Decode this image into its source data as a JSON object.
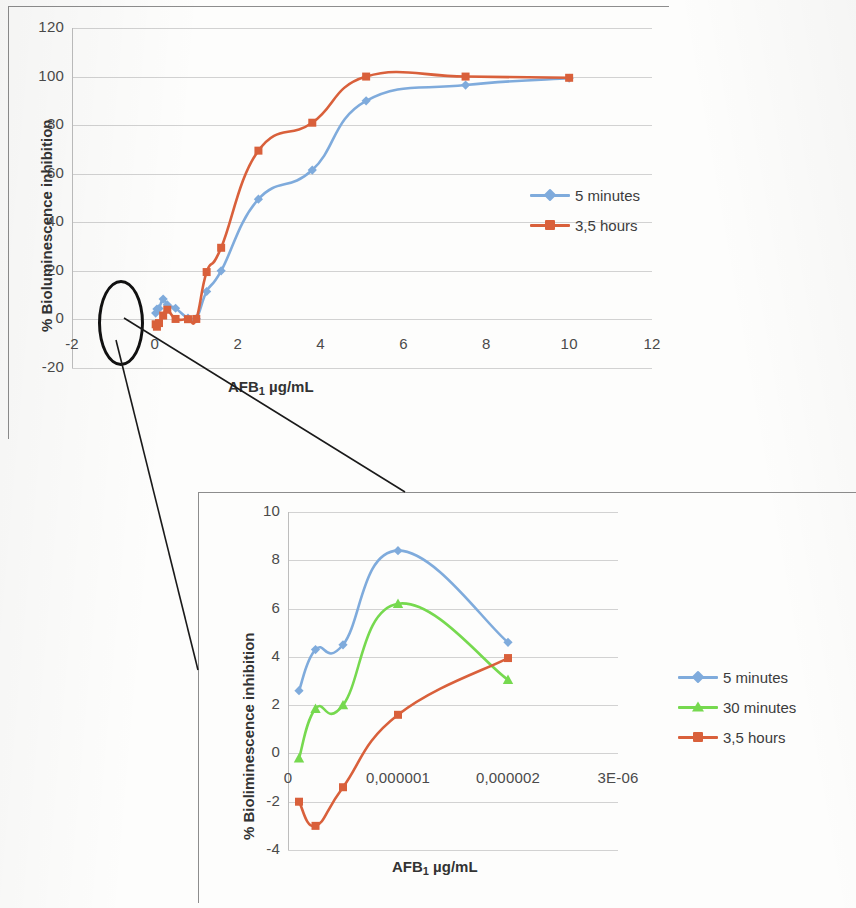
{
  "figure": {
    "kind": "scanned-figure"
  },
  "colors": {
    "series_blue": "#7FABDC",
    "series_green": "#76D94F",
    "series_orange": "#D9603B",
    "gridline": "#d2d2d2",
    "axis": "#bdbdbd",
    "text": "#4a4a4a",
    "annotation": "#111111"
  },
  "top_chart": {
    "ylabel": "% Bioluminescence inhibition",
    "xlabel_text": "AFB",
    "xlabel_sub": "1",
    "xlabel_tail": " µg/mL",
    "y_ticks": [
      "-20",
      "0",
      "20",
      "40",
      "60",
      "80",
      "100",
      "120"
    ],
    "x_ticks": [
      "-2",
      "0",
      "2",
      "4",
      "6",
      "8",
      "10",
      "12"
    ],
    "legend": [
      {
        "label": "5 minutes",
        "color": "#7FABDC",
        "marker": "diamond"
      },
      {
        "label": "3,5 hours",
        "color": "#D9603B",
        "marker": "square"
      }
    ]
  },
  "bottom_chart": {
    "ylabel": "% Bioliminescence inhibition",
    "xlabel_text": "AFB",
    "xlabel_sub": "1",
    "xlabel_tail": " µg/mL",
    "y_ticks": [
      "-4",
      "-2",
      "0",
      "2",
      "4",
      "6",
      "8",
      "10"
    ],
    "x_ticks": [
      "0",
      "0,000001",
      "0,000002",
      "3E-06"
    ],
    "legend": [
      {
        "label": "5 minutes",
        "color": "#7FABDC",
        "marker": "diamond"
      },
      {
        "label": "30 minutes",
        "color": "#76D94F",
        "marker": "triangle"
      },
      {
        "label": "3,5 hours",
        "color": "#D9603B",
        "marker": "square"
      }
    ]
  },
  "chart_data": [
    {
      "type": "line",
      "id": "main-dose-response",
      "title": "",
      "xlabel": "AFB1 µg/mL",
      "ylabel": "% Bioluminescence inhibition",
      "xlim": [
        -2,
        12
      ],
      "ylim": [
        -20,
        120
      ],
      "xticks": [
        -2,
        0,
        2,
        4,
        6,
        8,
        10,
        12
      ],
      "yticks": [
        -20,
        0,
        20,
        40,
        60,
        80,
        100,
        120
      ],
      "grid": true,
      "legend_position": "right",
      "series": [
        {
          "name": "5 minutes",
          "color": "#7FABDC",
          "marker": "diamond",
          "x": [
            0.02,
            0.05,
            0.1,
            0.2,
            0.3,
            0.5,
            0.8,
            1.0,
            1.25,
            1.6,
            2.5,
            3.8,
            5.1,
            7.5,
            10.0
          ],
          "y": [
            2.6,
            4.3,
            4.5,
            8.4,
            6.0,
            4.6,
            0.5,
            0.3,
            11.5,
            20.0,
            49.5,
            61.5,
            90.0,
            96.5,
            99.3
          ]
        },
        {
          "name": "3,5 hours",
          "color": "#D9603B",
          "marker": "square",
          "x": [
            0.02,
            0.05,
            0.1,
            0.2,
            0.3,
            0.5,
            0.8,
            1.0,
            1.25,
            1.6,
            2.5,
            3.8,
            5.1,
            7.5,
            10.0
          ],
          "y": [
            -2.0,
            -3.0,
            -1.5,
            1.6,
            4.0,
            0.2,
            0.1,
            0.2,
            19.5,
            29.5,
            69.5,
            81.0,
            100.0,
            100.0,
            99.5
          ]
        }
      ]
    },
    {
      "type": "line",
      "id": "magnified-inset",
      "title": "",
      "xlabel": "AFB1 µg/mL",
      "ylabel": "% Bioliminescence inhibition",
      "xlim": [
        0,
        3e-06
      ],
      "ylim": [
        -4,
        10
      ],
      "xticks": [
        0,
        1e-06,
        2e-06,
        3e-06
      ],
      "xticklabels": [
        "0",
        "0,000001",
        "0,000002",
        "3E-06"
      ],
      "yticks": [
        -4,
        -2,
        0,
        2,
        4,
        6,
        8,
        10
      ],
      "grid": true,
      "legend_position": "right",
      "series": [
        {
          "name": "5 minutes",
          "color": "#7FABDC",
          "marker": "diamond",
          "x": [
            1e-07,
            2.5e-07,
            5e-07,
            1e-06,
            2e-06
          ],
          "y": [
            2.6,
            4.3,
            4.5,
            8.4,
            4.6
          ]
        },
        {
          "name": "30 minutes",
          "color": "#76D94F",
          "marker": "triangle",
          "x": [
            1e-07,
            2.5e-07,
            5e-07,
            1e-06,
            2e-06
          ],
          "y": [
            -0.2,
            1.85,
            2.0,
            6.2,
            3.05
          ]
        },
        {
          "name": "3,5 hours",
          "color": "#D9603B",
          "marker": "square",
          "x": [
            1e-07,
            2.5e-07,
            5e-07,
            1e-06,
            2e-06
          ],
          "y": [
            -2.0,
            -3.0,
            -1.4,
            1.6,
            3.95
          ]
        }
      ]
    }
  ],
  "annotations": {
    "ellipse_label": "magnified-region-ellipse",
    "leader_lines": 2
  }
}
